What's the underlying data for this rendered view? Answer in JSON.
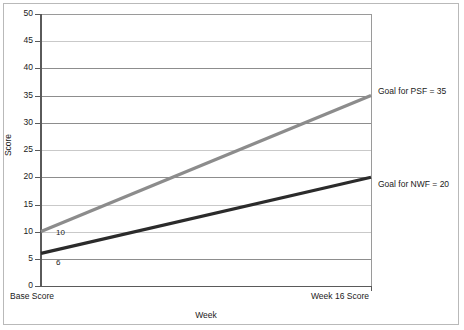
{
  "chart_data": {
    "type": "line",
    "title": "",
    "xlabel": "Week",
    "ylabel": "Score",
    "categories": [
      "Base Score",
      "Week 16 Score"
    ],
    "ylim": [
      0,
      50
    ],
    "y_ticks": [
      0,
      5,
      10,
      15,
      20,
      25,
      30,
      35,
      40,
      45,
      50
    ],
    "grid": true,
    "legend_position": "none",
    "series": [
      {
        "name": "PSF",
        "color": "#8c8c8c",
        "values": [
          10,
          35
        ],
        "start_label": "10",
        "end_annotation": "Goal for PSF = 35"
      },
      {
        "name": "NWF",
        "color": "#2b2b2b",
        "values": [
          6,
          20
        ],
        "start_label": "6",
        "end_annotation": "Goal for NWF = 20"
      }
    ],
    "annotations": [
      "Goal for PSF = 35",
      "Goal for NWF = 20"
    ]
  },
  "axes": {
    "y_title": "Score",
    "x_title": "Week",
    "y_tick_labels": [
      "50",
      "45",
      "40",
      "35",
      "30",
      "25",
      "20",
      "15",
      "10",
      "5",
      "0"
    ],
    "x_category_left": "Base Score",
    "x_category_right": "Week 16 Score"
  },
  "colors": {
    "psf_line": "#8c8c8c",
    "nwf_line": "#2b2b2b",
    "grid_dark": "#8d8d8d",
    "grid_light": "#c9c9c9",
    "axis": "#5a5a5a",
    "frame": "#b9b9b9",
    "text": "#1a1a1a"
  }
}
